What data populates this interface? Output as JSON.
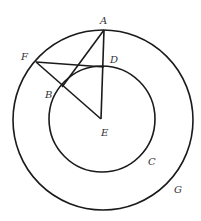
{
  "diagram": {
    "type": "geometry",
    "colors": {
      "stroke": "#1a1a1a",
      "label": "#333333",
      "background": "#ffffff"
    },
    "circles": [
      {
        "name": "G",
        "label": "G",
        "cx": 103,
        "cy": 120,
        "r": 90
      },
      {
        "name": "C",
        "label": "C",
        "cx": 102,
        "cy": 119,
        "r": 53
      }
    ],
    "points": {
      "A": {
        "label": "A",
        "x": 104,
        "y": 30
      },
      "D": {
        "label": "D",
        "x": 104,
        "y": 67
      },
      "F": {
        "label": "F",
        "x": 36,
        "y": 62
      },
      "B": {
        "label": "B",
        "x": 62,
        "y": 87
      },
      "E": {
        "label": "E",
        "x": 101,
        "y": 119
      }
    },
    "segments": [
      "A-E",
      "A-B",
      "F-D",
      "F-E"
    ],
    "labels": {
      "A": "A",
      "B": "B",
      "C": "C",
      "D": "D",
      "E": "E",
      "F": "F",
      "G": "G"
    }
  }
}
